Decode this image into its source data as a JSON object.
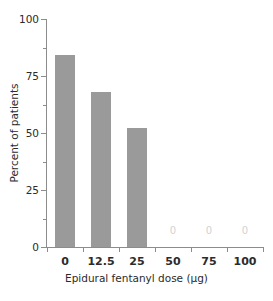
{
  "chart_data": {
    "type": "bar",
    "title": "",
    "xlabel": "Epidural fentanyl dose (µg)",
    "ylabel": "Percent of patients",
    "categories": [
      "0",
      "12.5",
      "25",
      "50",
      "75",
      "100"
    ],
    "values": [
      84,
      68,
      52,
      0,
      0,
      0
    ],
    "data_labels": [
      "",
      "",
      "",
      "0",
      "0",
      "0"
    ],
    "ylim": [
      0,
      100
    ],
    "y_major_ticks": [
      0,
      25,
      50,
      75,
      100
    ],
    "y_major_tick_labels": [
      "0",
      "25",
      "50",
      "75",
      "100"
    ],
    "y_minor_ticks": [
      12.5,
      37.5,
      62.5,
      87.5
    ],
    "grid": false,
    "legend": false,
    "bar_color": "#9a9a9a",
    "axis_color": "#8c8c8c",
    "text_color": "#2b2b2b",
    "zero_label_color": "#d2d2d2",
    "background": "#ffffff"
  }
}
